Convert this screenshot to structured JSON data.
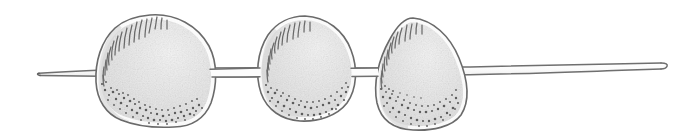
{
  "figure": {
    "title": "Three rounded bodies threaded on a slender stem",
    "medium": "hand-drawn pencil and ink line illustration",
    "background_color": "#ffffff",
    "outline_color": "#6f6f6f",
    "outline_color_dark": "#5a5a5a",
    "fill_color": "#e3e3e3",
    "fill_highlight_color": "#f2f2f2",
    "stipple_color": "#5c5c5c",
    "hatch_color": "#6a6a6a",
    "stem": {
      "label": "stem",
      "left_tip_x": 38,
      "right_tip_x": 666,
      "center_y": 72,
      "thickness": 9,
      "left_tip_shape": "tapered-point",
      "right_tip_shape": "rounded-taper"
    },
    "bodies": [
      {
        "index": 1,
        "label": "body-left",
        "shape": "rounded-irregular-disc",
        "bbox": {
          "x": 95,
          "y": 14,
          "width": 122,
          "height": 114
        },
        "hatching_region": "upper-left-margin",
        "hatch_count": 17,
        "stipple_region": "lower-left-arc",
        "stipple_count": 62
      },
      {
        "index": 2,
        "label": "body-middle",
        "shape": "rounded-oval",
        "bbox": {
          "x": 257,
          "y": 16,
          "width": 100,
          "height": 106
        },
        "hatching_region": "upper-left-margin",
        "hatch_count": 13,
        "stipple_region": "lower-left-arc",
        "stipple_count": 55
      },
      {
        "index": 3,
        "label": "body-right",
        "shape": "teardrop-pear",
        "bbox": {
          "x": 375,
          "y": 17,
          "width": 97,
          "height": 114
        },
        "hatching_region": "upper-left-margin",
        "hatch_count": 13,
        "stipple_region": "lower-arc",
        "stipple_count": 58
      }
    ]
  }
}
